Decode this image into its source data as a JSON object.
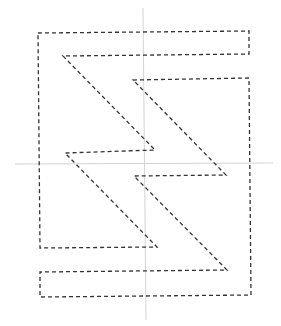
{
  "diagram": {
    "width": 281,
    "height": 326,
    "background": "#ffffff",
    "axes": {
      "color": "#d4d4d4",
      "horizontal": {
        "x1": 15,
        "y1": 164,
        "x2": 273,
        "y2": 163
      },
      "vertical": {
        "x1": 143,
        "y1": 8,
        "x2": 146,
        "y2": 320
      }
    },
    "stroke": {
      "color": "#333333",
      "width": 1.3,
      "dasharray": "4 3"
    },
    "shapes": [
      {
        "name": "upper-left-bolt",
        "points": "38,33 249,31 249,54 63,56 155,150 65,153 157,247 40,248"
      },
      {
        "name": "lower-right-bolt",
        "points": "133,80 249,78 251,295 40,297 40,272 227,270 134,176 226,175"
      }
    ]
  }
}
